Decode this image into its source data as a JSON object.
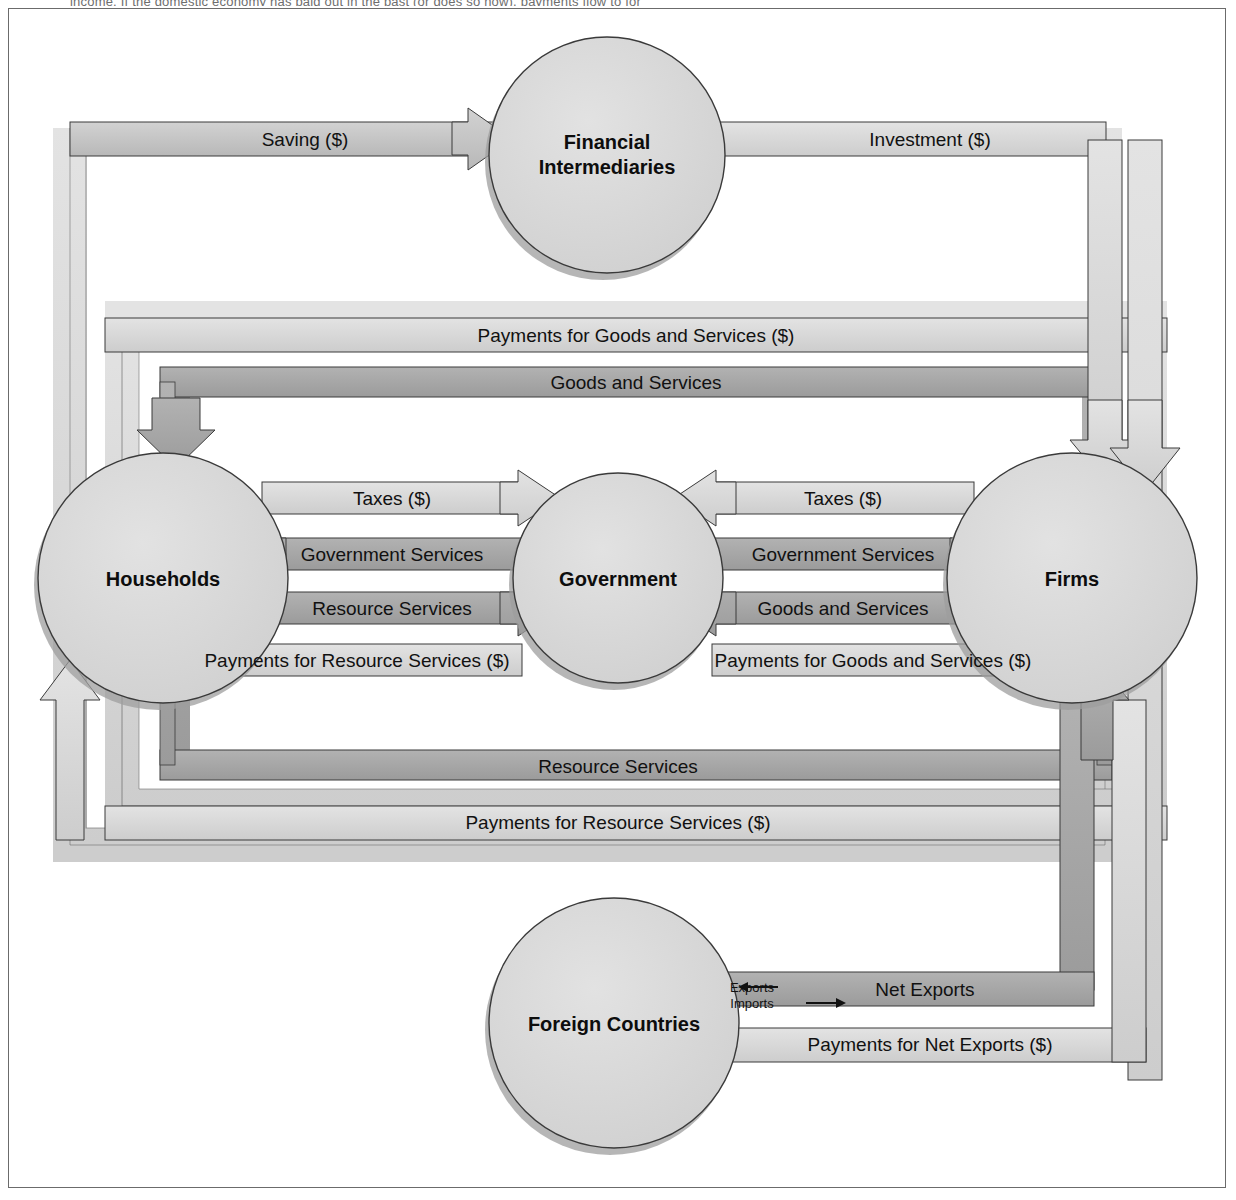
{
  "page": {
    "truncated_top_text": "income. If the domestic economy has paid out in the past    (or does so now), payments flow to for"
  },
  "colors": {
    "band_light": "#d6d6d6",
    "band_mid": "#c2c2c2",
    "band_dark": "#a6a6a6",
    "node_fill": "#d9d9d9",
    "outline": "#3a3a3a",
    "shadow": "#8f8f8f",
    "text": "#111111",
    "page_border": "#6b6b6b",
    "background": "#ffffff"
  },
  "nodes": [
    {
      "id": "financial-intermediaries",
      "label_line1": "Financial",
      "label_line2": "Intermediaries",
      "cx": 607,
      "cy": 155,
      "r": 118
    },
    {
      "id": "households",
      "label_line1": "Households",
      "label_line2": "",
      "cx": 163,
      "cy": 578,
      "r": 125
    },
    {
      "id": "government",
      "label_line1": "Government",
      "label_line2": "",
      "cx": 618,
      "cy": 578,
      "r": 105
    },
    {
      "id": "firms",
      "label_line1": "Firms",
      "label_line2": "",
      "cx": 1072,
      "cy": 578,
      "r": 125
    },
    {
      "id": "foreign-countries",
      "label_line1": "Foreign Countries",
      "label_line2": "",
      "cx": 614,
      "cy": 1023,
      "r": 125
    }
  ],
  "flows": [
    {
      "id": "saving",
      "label": "Saving ($)",
      "direction": "right",
      "tone": "mid"
    },
    {
      "id": "investment",
      "label": "Investment ($)",
      "direction": "left",
      "tone": "light"
    },
    {
      "id": "payments-goods-outer",
      "label": "Payments for Goods and Services ($)",
      "direction": "left",
      "tone": "light"
    },
    {
      "id": "goods-services-outer",
      "label": "Goods and Services",
      "direction": "left",
      "tone": "dark"
    },
    {
      "id": "taxes-households",
      "label": "Taxes ($)",
      "direction": "right",
      "tone": "light"
    },
    {
      "id": "govt-services-households",
      "label": "Government Services",
      "direction": "left",
      "tone": "dark"
    },
    {
      "id": "resource-services-govt",
      "label": "Resource Services",
      "direction": "right",
      "tone": "dark"
    },
    {
      "id": "taxes-firms",
      "label": "Taxes ($)",
      "direction": "left",
      "tone": "light"
    },
    {
      "id": "govt-services-firms",
      "label": "Government Services",
      "direction": "right",
      "tone": "dark"
    },
    {
      "id": "goods-services-govt",
      "label": "Goods and Services",
      "direction": "left",
      "tone": "dark"
    },
    {
      "id": "payments-resource-households",
      "label": "Payments for Resource Services ($)",
      "direction": "left",
      "tone": "light"
    },
    {
      "id": "payments-goods-firms",
      "label": "Payments for Goods and Services ($)",
      "direction": "right",
      "tone": "light"
    },
    {
      "id": "resource-services-outer",
      "label": "Resource Services",
      "direction": "right",
      "tone": "dark"
    },
    {
      "id": "payments-resource-outer",
      "label": "Payments for Resource Services ($)",
      "direction": "right",
      "tone": "light"
    },
    {
      "id": "net-exports",
      "label": "Net Exports",
      "direction": "left",
      "tone": "dark"
    },
    {
      "id": "payments-net-exports",
      "label": "Payments for Net Exports ($)",
      "direction": "right",
      "tone": "light"
    }
  ],
  "net_export_legend": {
    "exports_label": "Exports",
    "exports_arrow": "←",
    "imports_label": "Imports",
    "imports_arrow": "→"
  }
}
